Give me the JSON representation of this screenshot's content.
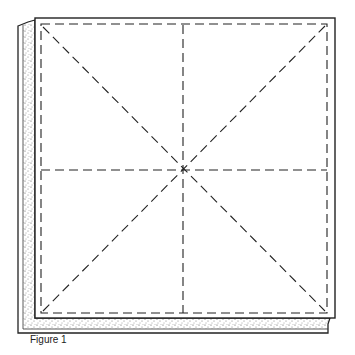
{
  "figure": {
    "caption": "Figure 1",
    "colors": {
      "line": "#222222",
      "stipple": "#555555",
      "background": "#ffffff"
    }
  }
}
